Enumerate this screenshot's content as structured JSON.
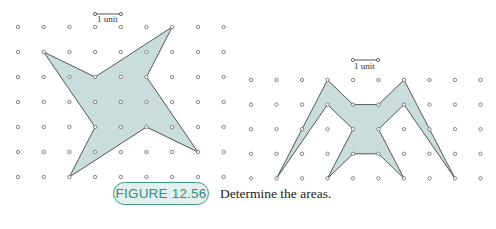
{
  "figure": {
    "label": "FIGURE 12.56",
    "caption": "Determine the areas.",
    "accent_color": "#3f9a8a",
    "shape_fill": "#c9dedc",
    "shape_stroke": "#555555",
    "dot_color": "#777777"
  },
  "left_grid": {
    "origin": [
      18,
      27
    ],
    "spacing": [
      25.7,
      25.0
    ],
    "cols": 9,
    "rows": 7,
    "scale_label": "1 unit",
    "scale_bar": {
      "x1": 95,
      "x2": 121,
      "y": 14
    },
    "polygon": [
      [
        1,
        1
      ],
      [
        3,
        2
      ],
      [
        6,
        0
      ],
      [
        5,
        2
      ],
      [
        7,
        5
      ],
      [
        5,
        4
      ],
      [
        2,
        6
      ],
      [
        3,
        4
      ]
    ]
  },
  "right_grid": {
    "origin": [
      251,
      80
    ],
    "spacing": [
      25.5,
      24.6
    ],
    "cols": 10,
    "rows": 5,
    "scale_label": "1 unit",
    "scale_bar": {
      "x1": 353,
      "x2": 378,
      "y": 60
    },
    "polygon": [
      [
        1,
        4
      ],
      [
        3,
        0
      ],
      [
        4,
        1
      ],
      [
        5,
        1
      ],
      [
        6,
        0
      ],
      [
        8,
        4
      ],
      [
        6,
        1
      ],
      [
        5,
        2
      ],
      [
        6,
        4
      ],
      [
        5,
        3
      ],
      [
        4,
        3
      ],
      [
        3,
        4
      ],
      [
        4,
        2
      ],
      [
        3,
        1
      ]
    ]
  }
}
